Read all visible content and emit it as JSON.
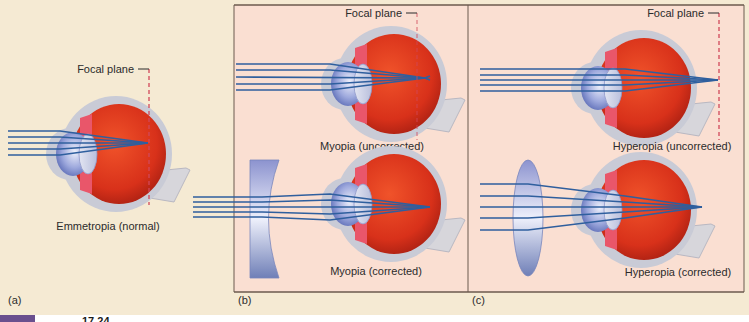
{
  "figure": {
    "panels": [
      {
        "id": "a",
        "tag": "(a)",
        "eyes": [
          {
            "caption": "Emmetropia (normal)",
            "focal_plane_label": "Focal plane",
            "focus": "on-retina",
            "lens": "none"
          }
        ]
      },
      {
        "id": "b",
        "tag": "(b)",
        "eyes": [
          {
            "caption": "Myopia (uncorrected)",
            "focal_plane_label": "Focal plane",
            "focus": "in-front-of-retina",
            "lens": "none"
          },
          {
            "caption": "Myopia (corrected)",
            "focus": "on-retina",
            "lens": "concave"
          }
        ]
      },
      {
        "id": "c",
        "tag": "(c)",
        "eyes": [
          {
            "caption": "Hyperopia (uncorrected)",
            "focal_plane_label": "Focal plane",
            "focus": "behind-retina",
            "lens": "none"
          },
          {
            "caption": "Hyperopia (corrected)",
            "focus": "on-retina",
            "lens": "convex"
          }
        ]
      }
    ],
    "footer_partial_text": "17.24",
    "colors": {
      "background": "#f5ead3",
      "panel_fill": "#fadfd2",
      "panel_border": "#6b5a4e",
      "eyeball_red": "#d8311a",
      "sclera": "#c9cbd6",
      "ray_blue": "#2f5f9e",
      "focal_plane_red": "#d2495a",
      "lens_blue": "#9aa4d6",
      "footer_bar": "#6a4f8e"
    }
  }
}
